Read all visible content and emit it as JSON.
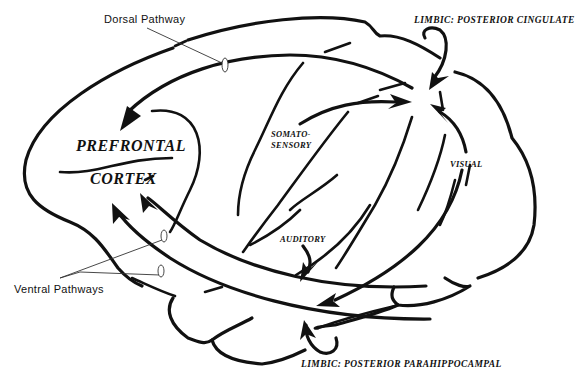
{
  "diagram": {
    "type": "brain-pathway-schematic",
    "colors": {
      "ink": "#111111",
      "background": "#ffffff"
    }
  },
  "labels": {
    "dorsal_pathway": "Dorsal Pathway",
    "ventral_pathways": "Ventral Pathways",
    "prefrontal": "PREFRONTAL",
    "cortex": "CORTEX",
    "somato_line1": "SOMATO-",
    "somato_line2": "SENSORY",
    "auditory": "AUDITORY",
    "visual": "VISUAL",
    "limbic_cingulate": "LIMBIC: POSTERIOR CINGULATE",
    "limbic_parahippocampal": "LIMBIC: POSTERIOR PARAHIPPOCAMPAL"
  },
  "connections": [
    {
      "from": "Posterior convergence zone (parietal)",
      "to": "PREFRONTAL CORTEX",
      "pathway": "Dorsal Pathway"
    },
    {
      "from": "SOMATOSENSORY",
      "to": "Posterior convergence zone (parietal)"
    },
    {
      "from": "VISUAL",
      "to": "Posterior convergence zone (parietal)"
    },
    {
      "from": "LIMBIC: POSTERIOR CINGULATE",
      "to": "Posterior convergence zone (parietal)"
    },
    {
      "from": "Temporal lobe",
      "to": "PREFRONTAL CORTEX",
      "pathway": "Ventral Pathways (upper)"
    },
    {
      "from": "Temporal lobe",
      "to": "PREFRONTAL CORTEX",
      "pathway": "Ventral Pathways (lower)"
    },
    {
      "from": "AUDITORY",
      "to": "Temporal lobe"
    },
    {
      "from": "VISUAL (occipital)",
      "to": "Temporal lobe (ventral)"
    },
    {
      "from": "LIMBIC: POSTERIOR PARAHIPPOCAMPAL",
      "to": "Temporal lobe (ventral)"
    }
  ]
}
